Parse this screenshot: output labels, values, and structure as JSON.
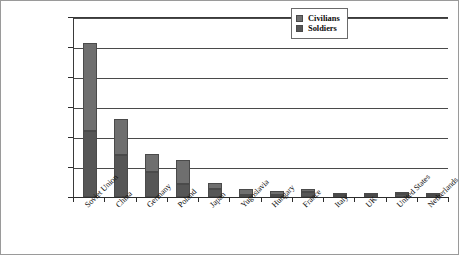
{
  "chart_data": {
    "type": "bar",
    "subtype": "stacked-vertical",
    "title": "",
    "xlabel": "",
    "ylabel": "",
    "ylim": [
      0,
      30000000
    ],
    "ytick_values": [
      0,
      5000000,
      10000000,
      15000000,
      20000000,
      25000000,
      30000000
    ],
    "ytick_labels": [
      "0",
      "5,000,000",
      "10,000,000",
      "15,000,000",
      "20,000,000",
      "25,000,000",
      "30,000,000"
    ],
    "grid": true,
    "grid_axis": "y",
    "legend_position": "top-right-inside",
    "categories": [
      "Soviet Union",
      "China",
      "Germany",
      "Poland",
      "Japan",
      "Yugoslavia",
      "Hungary",
      "France",
      "Italy",
      "UK",
      "United States",
      "Netherlands"
    ],
    "series": [
      {
        "name": "Civilians",
        "color": "#6f6f6f",
        "values": [
          14600000,
          6000000,
          3000000,
          4000000,
          1000000,
          1000000,
          700000,
          500000,
          200000,
          70000,
          12000,
          200000
        ]
      },
      {
        "name": "Soldiers",
        "color": "#565656",
        "values": [
          11000000,
          7000000,
          4200000,
          2200000,
          1400000,
          400000,
          300000,
          900000,
          400000,
          400000,
          420000,
          200000
        ]
      }
    ],
    "totals": [
      25600000,
      13000000,
      7200000,
      6200000,
      2400000,
      1400000,
      1000000,
      1400000,
      600000,
      470000,
      432000,
      400000
    ]
  },
  "legend": {
    "entries": [
      {
        "label": "Civilians",
        "color": "#6f6f6f"
      },
      {
        "label": "Soldiers",
        "color": "#565656"
      }
    ]
  }
}
